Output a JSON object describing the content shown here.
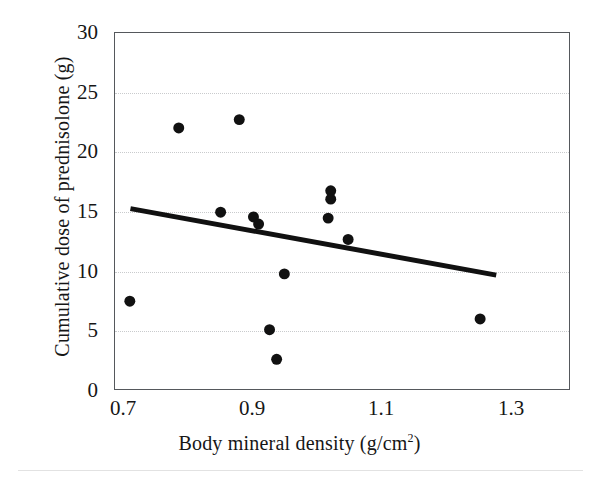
{
  "chart_data": {
    "type": "scatter",
    "title": "",
    "xlabel": "Body mineral density  (g/cm2)",
    "xlabel_main": "Body mineral  density  (g/cm",
    "xlabel_sup": "2",
    "xlabel_tail": ")",
    "ylabel": "Cumulative  dose of prednisolone  (g)",
    "xlim": [
      0.686,
      1.391
    ],
    "ylim": [
      0,
      30
    ],
    "xticks": [
      0.7,
      0.9,
      1.1,
      1.3
    ],
    "xtick_labels": [
      "0.7",
      "0.9",
      "1.1",
      "1.3"
    ],
    "yticks": [
      0,
      5,
      10,
      15,
      20,
      25,
      30
    ],
    "ytick_labels": [
      "0",
      "5",
      "10",
      "15",
      "20",
      "25",
      "30"
    ],
    "grid": "horizontal-dotted",
    "legend": "none",
    "marker_color": "#111111",
    "marker_shape": "circle",
    "marker_size_px": 11,
    "points": [
      {
        "x": 0.709,
        "y": 7.4
      },
      {
        "x": 0.785,
        "y": 22.0
      },
      {
        "x": 0.85,
        "y": 14.9
      },
      {
        "x": 0.879,
        "y": 22.7
      },
      {
        "x": 0.901,
        "y": 14.5
      },
      {
        "x": 0.909,
        "y": 13.9
      },
      {
        "x": 0.926,
        "y": 5.0
      },
      {
        "x": 0.937,
        "y": 2.5
      },
      {
        "x": 0.949,
        "y": 9.7
      },
      {
        "x": 1.017,
        "y": 14.4
      },
      {
        "x": 1.021,
        "y": 16.7
      },
      {
        "x": 1.021,
        "y": 16.0
      },
      {
        "x": 1.048,
        "y": 12.6
      },
      {
        "x": 1.253,
        "y": 5.9
      }
    ],
    "trendline": {
      "type": "linear",
      "color": "#111111",
      "width_px": 5,
      "x0": 0.71,
      "y0": 15.2,
      "x1": 1.278,
      "y1": 9.6
    }
  }
}
